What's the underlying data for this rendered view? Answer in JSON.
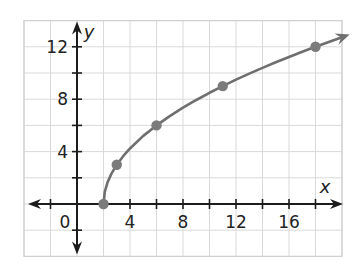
{
  "chart_data": {
    "type": "line",
    "title": "",
    "xlabel": "x",
    "ylabel": "y",
    "xlim": [
      -4,
      20
    ],
    "ylim": [
      -4,
      14
    ],
    "grid": true,
    "grid_step": 2,
    "tick_step": 2,
    "x_tick_labels": [
      {
        "value": 0,
        "label": "0"
      },
      {
        "value": 4,
        "label": "4"
      },
      {
        "value": 8,
        "label": "8"
      },
      {
        "value": 12,
        "label": "12"
      },
      {
        "value": 16,
        "label": "16"
      }
    ],
    "y_tick_labels": [
      {
        "value": 4,
        "label": "4"
      },
      {
        "value": 8,
        "label": "8"
      },
      {
        "value": 12,
        "label": "12"
      }
    ],
    "series": [
      {
        "name": "curve",
        "style": "line-with-end-arrow",
        "color": "#6f6f6f",
        "points": [
          [
            2,
            0
          ],
          [
            2.1,
            0.95
          ],
          [
            2.3,
            1.64
          ],
          [
            2.6,
            2.32
          ],
          [
            3,
            3
          ],
          [
            3.5,
            3.67
          ],
          [
            4,
            4.24
          ],
          [
            5,
            5.2
          ],
          [
            6,
            6
          ],
          [
            7,
            6.71
          ],
          [
            8,
            7.35
          ],
          [
            9,
            7.94
          ],
          [
            10,
            8.49
          ],
          [
            11,
            9
          ],
          [
            12,
            9.49
          ],
          [
            13,
            9.95
          ],
          [
            14,
            10.39
          ],
          [
            15,
            10.82
          ],
          [
            16,
            11.22
          ],
          [
            17,
            11.62
          ],
          [
            18,
            12
          ],
          [
            19,
            12.37
          ],
          [
            20,
            12.73
          ]
        ]
      },
      {
        "name": "marked points",
        "style": "markers",
        "color": "#7b7b7b",
        "points": [
          [
            2,
            0
          ],
          [
            3,
            3
          ],
          [
            6,
            6
          ],
          [
            11,
            9
          ],
          [
            18,
            12
          ]
        ]
      }
    ],
    "colors": {
      "grid": "#d9d9d9",
      "axis": "#1c1c1c",
      "curve": "#6f6f6f",
      "marker": "#7b7b7b"
    }
  }
}
